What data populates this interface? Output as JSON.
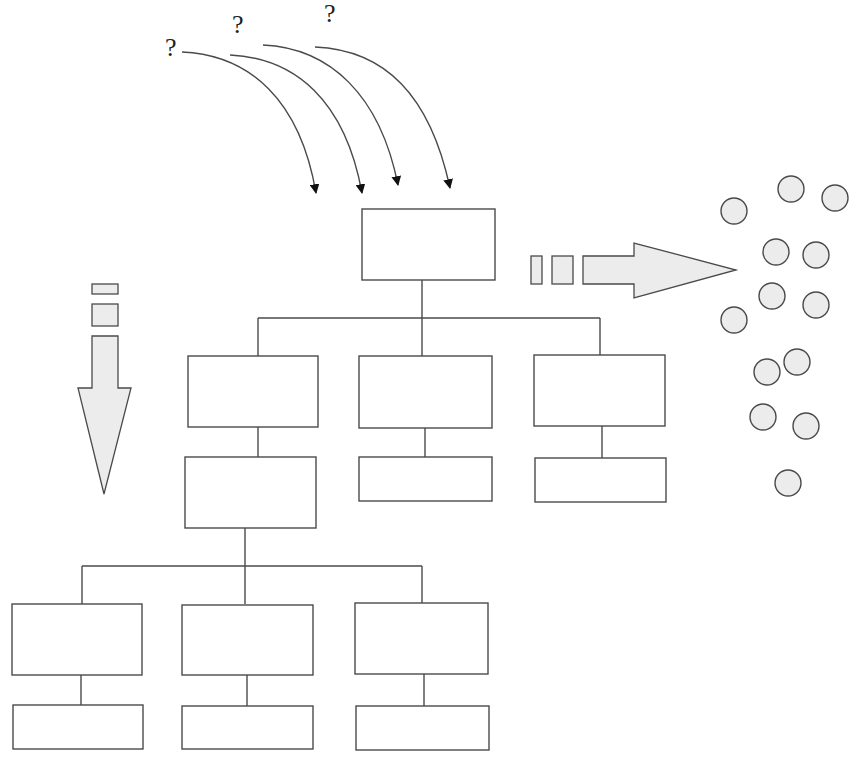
{
  "diagram": {
    "title": "",
    "colors": {
      "stroke": "#4a4a4a",
      "box_fill": "#ffffff",
      "shape_fill": "#ececec",
      "arrow_head": "#111111",
      "background": "#ffffff"
    },
    "question_marks": [
      {
        "text": "?",
        "x": 165,
        "y": 35
      },
      {
        "text": "?",
        "x": 232,
        "y": 12
      },
      {
        "text": "?",
        "x": 324,
        "y": 1
      }
    ],
    "incoming_arrows": [
      {
        "from": [
          182,
          52
        ],
        "c1": [
          250,
          55
        ],
        "c2": [
          300,
          100
        ],
        "to": [
          316,
          193
        ]
      },
      {
        "from": [
          230,
          55
        ],
        "c1": [
          295,
          58
        ],
        "c2": [
          345,
          100
        ],
        "to": [
          362,
          193
        ]
      },
      {
        "from": [
          263,
          45
        ],
        "c1": [
          330,
          48
        ],
        "c2": [
          380,
          95
        ],
        "to": [
          398,
          185
        ]
      },
      {
        "from": [
          315,
          47
        ],
        "c1": [
          385,
          50
        ],
        "c2": [
          430,
          95
        ],
        "to": [
          450,
          188
        ]
      }
    ],
    "boxes": [
      {
        "id": "root",
        "x": 362,
        "y": 209,
        "w": 133,
        "h": 71
      },
      {
        "id": "l2-a",
        "x": 188,
        "y": 356,
        "w": 130,
        "h": 71
      },
      {
        "id": "l2-b",
        "x": 359,
        "y": 356,
        "w": 133,
        "h": 72
      },
      {
        "id": "l2-c",
        "x": 534,
        "y": 355,
        "w": 131,
        "h": 71
      },
      {
        "id": "l2-a-sub",
        "x": 185,
        "y": 457,
        "w": 131,
        "h": 71
      },
      {
        "id": "l2-b-sub",
        "x": 359,
        "y": 457,
        "w": 133,
        "h": 44
      },
      {
        "id": "l2-c-sub",
        "x": 535,
        "y": 458,
        "w": 131,
        "h": 44
      },
      {
        "id": "l3-d",
        "x": 12,
        "y": 604,
        "w": 130,
        "h": 71
      },
      {
        "id": "l3-e",
        "x": 182,
        "y": 605,
        "w": 131,
        "h": 70
      },
      {
        "id": "l3-f",
        "x": 355,
        "y": 603,
        "w": 133,
        "h": 71
      },
      {
        "id": "l3-d-sub",
        "x": 13,
        "y": 705,
        "w": 130,
        "h": 44
      },
      {
        "id": "l3-e-sub",
        "x": 182,
        "y": 706,
        "w": 131,
        "h": 43
      },
      {
        "id": "l3-f-sub",
        "x": 356,
        "y": 706,
        "w": 133,
        "h": 44
      }
    ],
    "connectors": [
      [
        [
          422,
          280
        ],
        [
          422,
          356
        ]
      ],
      [
        [
          258,
          318
        ],
        [
          600,
          318
        ]
      ],
      [
        [
          258,
          318
        ],
        [
          258,
          356
        ]
      ],
      [
        [
          600,
          318
        ],
        [
          600,
          355
        ]
      ],
      [
        [
          258,
          427
        ],
        [
          258,
          457
        ]
      ],
      [
        [
          425,
          428
        ],
        [
          425,
          457
        ]
      ],
      [
        [
          602,
          426
        ],
        [
          602,
          458
        ]
      ],
      [
        [
          245,
          528
        ],
        [
          245,
          604
        ]
      ],
      [
        [
          82,
          566
        ],
        [
          422,
          566
        ]
      ],
      [
        [
          82,
          566
        ],
        [
          82,
          604
        ]
      ],
      [
        [
          422,
          566
        ],
        [
          422,
          603
        ]
      ],
      [
        [
          81,
          675
        ],
        [
          81,
          705
        ]
      ],
      [
        [
          247,
          675
        ],
        [
          247,
          706
        ]
      ],
      [
        [
          424,
          674
        ],
        [
          424,
          706
        ]
      ]
    ],
    "right_arrow": {
      "segments": [
        {
          "x": 531,
          "y": 256,
          "w": 11,
          "h": 28
        },
        {
          "x": 552,
          "y": 256,
          "w": 21,
          "h": 28
        }
      ],
      "shape": [
        [
          583,
          256
        ],
        [
          634,
          256
        ],
        [
          634,
          243
        ],
        [
          736,
          270
        ],
        [
          634,
          298
        ],
        [
          634,
          284
        ],
        [
          583,
          284
        ]
      ]
    },
    "down_arrow": {
      "segments": [
        {
          "x": 92,
          "y": 284,
          "w": 26,
          "h": 10
        },
        {
          "x": 92,
          "y": 304,
          "w": 26,
          "h": 22
        }
      ],
      "shape": [
        [
          92,
          336
        ],
        [
          118,
          336
        ],
        [
          118,
          388
        ],
        [
          131,
          388
        ],
        [
          104,
          494
        ],
        [
          78,
          388
        ],
        [
          92,
          388
        ]
      ]
    },
    "circles": [
      {
        "cx": 734,
        "cy": 211,
        "r": 13
      },
      {
        "cx": 791,
        "cy": 189,
        "r": 13
      },
      {
        "cx": 835,
        "cy": 198,
        "r": 13
      },
      {
        "cx": 776,
        "cy": 252,
        "r": 13
      },
      {
        "cx": 816,
        "cy": 255,
        "r": 13
      },
      {
        "cx": 772,
        "cy": 296,
        "r": 13
      },
      {
        "cx": 816,
        "cy": 305,
        "r": 13
      },
      {
        "cx": 734,
        "cy": 320,
        "r": 13
      },
      {
        "cx": 767,
        "cy": 372,
        "r": 13
      },
      {
        "cx": 797,
        "cy": 362,
        "r": 13
      },
      {
        "cx": 763,
        "cy": 417,
        "r": 13
      },
      {
        "cx": 806,
        "cy": 426,
        "r": 13
      },
      {
        "cx": 788,
        "cy": 483,
        "r": 13
      }
    ]
  }
}
